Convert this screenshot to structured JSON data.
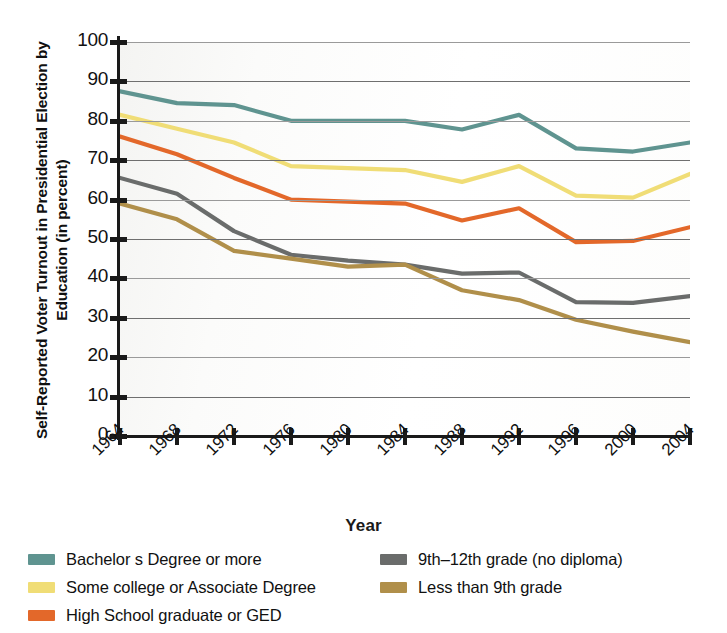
{
  "chart_data": {
    "type": "line",
    "title": "",
    "ylabel": "Self-Reported Voter Turnout in Presidential Election by Education (in percent)",
    "xlabel": "Year",
    "x": [
      1964,
      1968,
      1972,
      1976,
      1980,
      1984,
      1988,
      1992,
      1996,
      2000,
      2004
    ],
    "xtick_labels": [
      "1964",
      "1968",
      "1972",
      "1976",
      "1980",
      "1984",
      "1988",
      "1992",
      "1996",
      "2000",
      "2004"
    ],
    "ytick_labels": [
      "100",
      "90",
      "80",
      "70",
      "60",
      "50",
      "40",
      "30",
      "20",
      "10",
      "0"
    ],
    "ylim": [
      0,
      100
    ],
    "ytick_step": 10,
    "grid": true,
    "legend_position": "bottom",
    "series": [
      {
        "name": "Bachelor s Degree or more",
        "color": "#5f9490",
        "values": [
          87.5,
          84.5,
          84.0,
          80.0,
          80.0,
          80.0,
          77.8,
          81.5,
          73.0,
          72.2,
          74.5
        ]
      },
      {
        "name": "Some college or Associate Degree",
        "color": "#f0dd76",
        "values": [
          81.5,
          78.0,
          74.5,
          68.5,
          68.0,
          67.5,
          64.5,
          68.5,
          61.0,
          60.5,
          66.5
        ]
      },
      {
        "name": "High School graduate or GED",
        "color": "#e3682a",
        "values": [
          76.0,
          71.5,
          65.5,
          60.0,
          59.5,
          59.0,
          54.7,
          57.8,
          49.2,
          49.5,
          53.0
        ]
      },
      {
        "name": "9th–12th grade (no diploma)",
        "color": "#6a6c6b",
        "values": [
          65.5,
          61.5,
          52.0,
          46.0,
          44.5,
          43.5,
          41.2,
          41.5,
          34.0,
          33.8,
          35.5
        ]
      },
      {
        "name": "Less than 9th grade",
        "color": "#b08f4a",
        "values": [
          59.0,
          55.0,
          47.0,
          45.0,
          43.0,
          43.5,
          37.0,
          34.5,
          29.5,
          26.5,
          23.8
        ]
      }
    ]
  },
  "axis": {
    "ylabel": "Self-Reported Voter Turnout in Presidential Election by Education (in percent)",
    "xlabel": "Year"
  },
  "legend": {
    "left": [
      {
        "label": "Bachelor s Degree or more",
        "color": "#5f9490"
      },
      {
        "label": "Some college or Associate Degree",
        "color": "#f0dd76"
      },
      {
        "label": "High School graduate or GED",
        "color": "#e3682a"
      }
    ],
    "right": [
      {
        "label": "9th–12th grade (no diploma)",
        "color": "#6a6c6b"
      },
      {
        "label": "Less than 9th grade",
        "color": "#b08f4a"
      }
    ]
  }
}
